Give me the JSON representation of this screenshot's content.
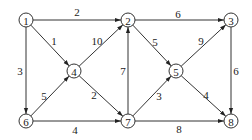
{
  "diagram": {
    "type": "directed-weighted-graph",
    "colors": {
      "stroke": "#333333",
      "text": "#222222",
      "background": "#ffffff"
    },
    "nodes": [
      {
        "id": "1",
        "label": "1",
        "x": 26,
        "y": 20
      },
      {
        "id": "2",
        "label": "2",
        "x": 128,
        "y": 20
      },
      {
        "id": "3",
        "label": "3",
        "x": 231,
        "y": 20
      },
      {
        "id": "4",
        "label": "4",
        "x": 74,
        "y": 71
      },
      {
        "id": "5",
        "label": "5",
        "x": 176,
        "y": 71
      },
      {
        "id": "6",
        "label": "6",
        "x": 26,
        "y": 121
      },
      {
        "id": "7",
        "label": "7",
        "x": 128,
        "y": 121
      },
      {
        "id": "8",
        "label": "8",
        "x": 231,
        "y": 121
      }
    ],
    "edges": [
      {
        "from": "1",
        "to": "2",
        "weight": "2",
        "lx": 77,
        "ly": 12
      },
      {
        "from": "1",
        "to": "4",
        "weight": "1",
        "lx": 54,
        "ly": 41
      },
      {
        "from": "1",
        "to": "6",
        "weight": "3",
        "lx": 20,
        "ly": 71
      },
      {
        "from": "4",
        "to": "2",
        "weight": "10",
        "lx": 97,
        "ly": 41
      },
      {
        "from": "6",
        "to": "4",
        "weight": "5",
        "lx": 44,
        "ly": 96
      },
      {
        "from": "4",
        "to": "7",
        "weight": "2",
        "lx": 94,
        "ly": 95
      },
      {
        "from": "6",
        "to": "7",
        "weight": "4",
        "lx": 75,
        "ly": 130
      },
      {
        "from": "7",
        "to": "2",
        "weight": "7",
        "lx": 123,
        "ly": 71
      },
      {
        "from": "2",
        "to": "5",
        "weight": "5",
        "lx": 155,
        "ly": 42
      },
      {
        "from": "2",
        "to": "3",
        "weight": "6",
        "lx": 178,
        "ly": 14
      },
      {
        "from": "5",
        "to": "3",
        "weight": "9",
        "lx": 201,
        "ly": 41
      },
      {
        "from": "7",
        "to": "5",
        "weight": "3",
        "lx": 159,
        "ly": 96
      },
      {
        "from": "5",
        "to": "8",
        "weight": "4",
        "lx": 206,
        "ly": 95
      },
      {
        "from": "3",
        "to": "8",
        "weight": "6",
        "lx": 236,
        "ly": 71
      },
      {
        "from": "7",
        "to": "8",
        "weight": "8",
        "lx": 179,
        "ly": 129
      }
    ]
  }
}
